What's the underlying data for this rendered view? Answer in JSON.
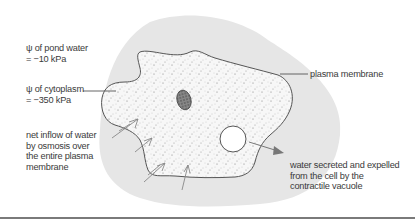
{
  "diagram": {
    "labels": {
      "pond_water_line1": "ψ of pond water",
      "pond_water_line2": "= −10 kPa",
      "cytoplasm_line1": "ψ of cytoplasm",
      "cytoplasm_line2": "= −350 kPa",
      "inflow_line1": "net inflow of water",
      "inflow_line2": "by osmosis over",
      "inflow_line3": "the entire plasma",
      "inflow_line4": "membrane",
      "plasma_membrane": "plasma membrane",
      "vacuole_line1": "water secreted and expelled",
      "vacuole_line2": "from the cell by the",
      "vacuole_line3": "contractile vacuole"
    },
    "colors": {
      "pond_water_halo": "#e6e6e6",
      "cytoplasm": "#f7f7f7",
      "outline": "#555555",
      "text": "#3a3a3a",
      "rule": "#7a7a7a"
    }
  }
}
